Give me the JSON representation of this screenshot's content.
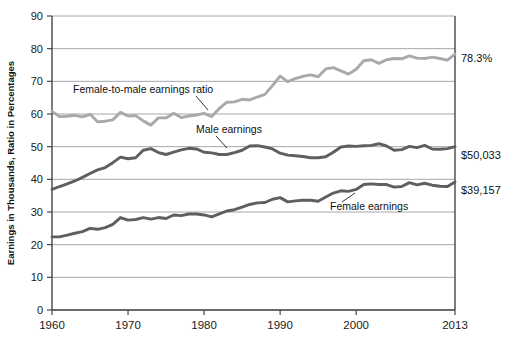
{
  "chart_data": {
    "type": "line",
    "title": "",
    "subtitle": "",
    "xlabel": "",
    "ylabel": "Earnings in Thousands, Ratio in Percentages",
    "xlim": [
      1960,
      2013
    ],
    "ylim": [
      0,
      90
    ],
    "grid": true,
    "legend_position": "inline-annotations",
    "yticks": [
      "0",
      "10",
      "20",
      "30",
      "40",
      "50",
      "60",
      "70",
      "80",
      "90"
    ],
    "ytick_values": [
      0,
      10,
      20,
      30,
      40,
      50,
      60,
      70,
      80,
      90
    ],
    "xticks": [
      "1960",
      "1970",
      "1980",
      "1990",
      "2000",
      "2013"
    ],
    "xtick_values": [
      1960,
      1970,
      1980,
      1990,
      2000,
      2013
    ],
    "x": [
      1960,
      1961,
      1962,
      1963,
      1964,
      1965,
      1966,
      1967,
      1968,
      1969,
      1970,
      1971,
      1972,
      1973,
      1974,
      1975,
      1976,
      1977,
      1978,
      1979,
      1980,
      1981,
      1982,
      1983,
      1984,
      1985,
      1986,
      1987,
      1988,
      1989,
      1990,
      1991,
      1992,
      1993,
      1994,
      1995,
      1996,
      1997,
      1998,
      1999,
      2000,
      2001,
      2002,
      2003,
      2004,
      2005,
      2006,
      2007,
      2008,
      2009,
      2010,
      2011,
      2012,
      2013
    ],
    "series": [
      {
        "name": "Female-to-male earnings ratio",
        "color": "#a7a9ab",
        "unit": "percent",
        "end_label": "78.3%",
        "values": [
          60.8,
          59.2,
          59.3,
          59.6,
          59.1,
          59.9,
          57.6,
          57.8,
          58.2,
          60.5,
          59.4,
          59.5,
          57.9,
          56.6,
          58.8,
          58.8,
          60.2,
          58.9,
          59.4,
          59.7,
          60.2,
          59.2,
          61.7,
          63.6,
          63.7,
          64.5,
          64.3,
          65.2,
          66.0,
          68.7,
          71.6,
          69.9,
          70.8,
          71.5,
          72.0,
          71.4,
          73.8,
          74.2,
          73.2,
          72.2,
          73.7,
          76.3,
          76.6,
          75.5,
          76.6,
          77.0,
          76.9,
          77.8,
          77.1,
          77.0,
          77.4,
          77.0,
          76.5,
          78.3
        ]
      },
      {
        "name": "Male earnings",
        "color": "#5d5f61",
        "unit": "thousands-of-dollars",
        "end_label": "$50,033",
        "values": [
          36.9,
          37.8,
          38.6,
          39.5,
          40.6,
          41.8,
          42.9,
          43.6,
          45.1,
          46.8,
          46.3,
          46.6,
          48.9,
          49.4,
          48.2,
          47.6,
          48.3,
          49.0,
          49.5,
          49.3,
          48.3,
          48.1,
          47.6,
          47.6,
          48.2,
          48.9,
          50.2,
          50.3,
          49.9,
          49.3,
          48.0,
          47.4,
          47.2,
          47.0,
          46.6,
          46.6,
          46.9,
          48.3,
          49.9,
          50.2,
          50.1,
          50.3,
          50.4,
          50.9,
          50.2,
          48.9,
          49.1,
          50.1,
          49.7,
          50.4,
          49.3,
          49.2,
          49.4,
          50.0
        ]
      },
      {
        "name": "Female earnings",
        "color": "#5d5f61",
        "unit": "thousands-of-dollars",
        "end_label": "$39,157",
        "values": [
          22.4,
          22.4,
          22.9,
          23.5,
          24.0,
          25.0,
          24.7,
          25.2,
          26.2,
          28.3,
          27.5,
          27.7,
          28.3,
          27.8,
          28.3,
          28.0,
          29.1,
          28.9,
          29.4,
          29.4,
          29.1,
          28.5,
          29.4,
          30.3,
          30.7,
          31.5,
          32.3,
          32.8,
          32.9,
          33.9,
          34.4,
          33.1,
          33.4,
          33.6,
          33.6,
          33.3,
          34.6,
          35.8,
          36.5,
          36.3,
          36.9,
          38.4,
          38.6,
          38.4,
          38.4,
          37.6,
          37.8,
          39.0,
          38.3,
          38.8,
          38.2,
          37.9,
          37.8,
          39.2
        ]
      }
    ],
    "annotations": [
      {
        "text": "Female-to-male earnings ratio",
        "series": "ratio"
      },
      {
        "text": "Male earnings",
        "series": "male"
      },
      {
        "text": "Female earnings",
        "series": "female"
      }
    ]
  }
}
